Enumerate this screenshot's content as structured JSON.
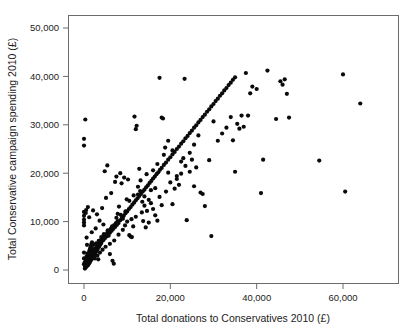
{
  "chart_data": {
    "type": "scatter",
    "title": "",
    "xlabel": "Total donations to Conservatives 2010 (£)",
    "ylabel": "Total Conservative campaign spending 2010 (£)",
    "xlim": [
      -2500,
      72000
    ],
    "ylim": [
      -1800,
      52500
    ],
    "xticks": [
      0,
      20000,
      40000,
      60000
    ],
    "xticklabels": [
      "0",
      "20,000",
      "40,000",
      "60,000"
    ],
    "yticks": [
      0,
      10000,
      20000,
      30000,
      40000,
      50000
    ],
    "yticklabels": [
      "0",
      "10,000",
      "20,000",
      "30,000",
      "40,000",
      "50,000"
    ],
    "grid": false,
    "legend": null,
    "marker": "filled-circle",
    "marker_color": "#0a0a0a",
    "marker_size_px": 4.2,
    "points": [
      [
        200,
        300
      ],
      [
        250,
        700
      ],
      [
        300,
        450
      ],
      [
        350,
        1100
      ],
      [
        400,
        800
      ],
      [
        450,
        1500
      ],
      [
        500,
        600
      ],
      [
        550,
        1800
      ],
      [
        600,
        1000
      ],
      [
        650,
        2100
      ],
      [
        700,
        1300
      ],
      [
        750,
        2400
      ],
      [
        800,
        900
      ],
      [
        850,
        2700
      ],
      [
        900,
        1600
      ],
      [
        950,
        3000
      ],
      [
        1000,
        1100
      ],
      [
        1050,
        3300
      ],
      [
        1100,
        2000
      ],
      [
        1150,
        3600
      ],
      [
        1200,
        1400
      ],
      [
        1250,
        3900
      ],
      [
        1300,
        2300
      ],
      [
        1350,
        4200
      ],
      [
        1400,
        1700
      ],
      [
        1450,
        4500
      ],
      [
        1500,
        2600
      ],
      [
        1550,
        4800
      ],
      [
        1600,
        2000
      ],
      [
        1650,
        5100
      ],
      [
        1700,
        2900
      ],
      [
        1750,
        5400
      ],
      [
        1800,
        2300
      ],
      [
        1850,
        5700
      ],
      [
        1900,
        3200
      ],
      [
        2000,
        2600
      ],
      [
        2100,
        3500
      ],
      [
        2200,
        2900
      ],
      [
        2300,
        3800
      ],
      [
        2400,
        3200
      ],
      [
        2500,
        4100
      ],
      [
        2600,
        3500
      ],
      [
        2700,
        4400
      ],
      [
        2800,
        3800
      ],
      [
        2900,
        4700
      ],
      [
        3000,
        4100
      ],
      [
        3100,
        5000
      ],
      [
        3200,
        4400
      ],
      [
        3300,
        5300
      ],
      [
        3400,
        4700
      ],
      [
        3500,
        5600
      ],
      [
        3600,
        5000
      ],
      [
        3700,
        5900
      ],
      [
        3800,
        5300
      ],
      [
        3900,
        6200
      ],
      [
        4000,
        5600
      ],
      [
        4200,
        6500
      ],
      [
        4400,
        6100
      ],
      [
        4600,
        6900
      ],
      [
        4800,
        6500
      ],
      [
        5000,
        7300
      ],
      [
        5200,
        6900
      ],
      [
        5400,
        7700
      ],
      [
        5600,
        7300
      ],
      [
        5800,
        8100
      ],
      [
        6000,
        7700
      ],
      [
        6200,
        8500
      ],
      [
        6400,
        8100
      ],
      [
        6600,
        8900
      ],
      [
        6800,
        8500
      ],
      [
        7000,
        9300
      ],
      [
        7200,
        8900
      ],
      [
        7400,
        9700
      ],
      [
        7600,
        9300
      ],
      [
        7800,
        10100
      ],
      [
        8000,
        9700
      ],
      [
        8400,
        10300
      ],
      [
        8800,
        10800
      ],
      [
        9200,
        11200
      ],
      [
        9600,
        11700
      ],
      [
        10000,
        12100
      ],
      [
        10400,
        12600
      ],
      [
        10800,
        13000
      ],
      [
        11200,
        13500
      ],
      [
        11600,
        13900
      ],
      [
        12000,
        14400
      ],
      [
        12400,
        14800
      ],
      [
        12800,
        15300
      ],
      [
        13200,
        15700
      ],
      [
        13600,
        16200
      ],
      [
        14000,
        16600
      ],
      [
        14400,
        17100
      ],
      [
        14800,
        17500
      ],
      [
        15200,
        18000
      ],
      [
        15600,
        18400
      ],
      [
        16000,
        18900
      ],
      [
        16400,
        19300
      ],
      [
        16800,
        19800
      ],
      [
        17200,
        20200
      ],
      [
        17600,
        20700
      ],
      [
        18000,
        21100
      ],
      [
        18500,
        21700
      ],
      [
        19000,
        22200
      ],
      [
        19500,
        22800
      ],
      [
        20000,
        23300
      ],
      [
        20500,
        23900
      ],
      [
        21000,
        24400
      ],
      [
        21500,
        25000
      ],
      [
        22000,
        25500
      ],
      [
        22500,
        26100
      ],
      [
        23000,
        26600
      ],
      [
        23500,
        27200
      ],
      [
        24000,
        27700
      ],
      [
        24500,
        28300
      ],
      [
        25000,
        28800
      ],
      [
        25500,
        29400
      ],
      [
        26000,
        29900
      ],
      [
        26500,
        30500
      ],
      [
        27000,
        31000
      ],
      [
        27500,
        31600
      ],
      [
        28000,
        32100
      ],
      [
        28500,
        32700
      ],
      [
        29000,
        33200
      ],
      [
        29500,
        33800
      ],
      [
        30000,
        34300
      ],
      [
        30500,
        34900
      ],
      [
        31000,
        35400
      ],
      [
        31500,
        36000
      ],
      [
        32000,
        36500
      ],
      [
        32500,
        37100
      ],
      [
        33000,
        37600
      ],
      [
        33500,
        38200
      ],
      [
        34000,
        38700
      ],
      [
        34500,
        39300
      ],
      [
        35000,
        39800
      ],
      [
        0,
        1200
      ],
      [
        0,
        2400
      ],
      [
        0,
        3600
      ],
      [
        0,
        9200
      ],
      [
        0,
        9800
      ],
      [
        0,
        10400
      ],
      [
        0,
        11200
      ],
      [
        0,
        12000
      ],
      [
        0,
        25700
      ],
      [
        0,
        27100
      ],
      [
        300,
        31100
      ],
      [
        400,
        11800
      ],
      [
        500,
        12400
      ],
      [
        600,
        6700
      ],
      [
        700,
        5200
      ],
      [
        900,
        13000
      ],
      [
        1200,
        10900
      ],
      [
        1500,
        4300
      ],
      [
        1800,
        7800
      ],
      [
        2100,
        12300
      ],
      [
        2400,
        3100
      ],
      [
        2700,
        8600
      ],
      [
        3000,
        11500
      ],
      [
        3300,
        2200
      ],
      [
        3600,
        10200
      ],
      [
        3900,
        5900
      ],
      [
        4200,
        12800
      ],
      [
        4500,
        9400
      ],
      [
        4800,
        20400
      ],
      [
        5100,
        14900
      ],
      [
        5400,
        21600
      ],
      [
        5700,
        7100
      ],
      [
        6000,
        3300
      ],
      [
        6300,
        15900
      ],
      [
        6600,
        1900
      ],
      [
        6900,
        1300
      ],
      [
        7200,
        18200
      ],
      [
        7500,
        19300
      ],
      [
        7800,
        11600
      ],
      [
        8100,
        13100
      ],
      [
        8400,
        20000
      ],
      [
        8700,
        17900
      ],
      [
        9000,
        8300
      ],
      [
        9300,
        19100
      ],
      [
        9600,
        12100
      ],
      [
        9900,
        14600
      ],
      [
        10200,
        18700
      ],
      [
        10500,
        7200
      ],
      [
        10800,
        6900
      ],
      [
        11100,
        6800
      ],
      [
        11400,
        9000
      ],
      [
        11700,
        31700
      ],
      [
        12000,
        29100
      ],
      [
        12200,
        29800
      ],
      [
        12500,
        15600
      ],
      [
        12800,
        20900
      ],
      [
        13100,
        18500
      ],
      [
        13400,
        11900
      ],
      [
        13700,
        10100
      ],
      [
        14000,
        13300
      ],
      [
        14300,
        8800
      ],
      [
        14600,
        12200
      ],
      [
        15000,
        9800
      ],
      [
        15500,
        16500
      ],
      [
        16000,
        12600
      ],
      [
        16500,
        11300
      ],
      [
        17000,
        10200
      ],
      [
        17500,
        39700
      ],
      [
        18000,
        31500
      ],
      [
        18300,
        31300
      ],
      [
        18800,
        25300
      ],
      [
        19500,
        26700
      ],
      [
        20000,
        18100
      ],
      [
        20500,
        13600
      ],
      [
        21000,
        16800
      ],
      [
        21500,
        19400
      ],
      [
        22000,
        17600
      ],
      [
        22500,
        22400
      ],
      [
        23000,
        23100
      ],
      [
        23300,
        39500
      ],
      [
        23800,
        10300
      ],
      [
        24500,
        20300
      ],
      [
        25000,
        22800
      ],
      [
        25500,
        17300
      ],
      [
        26000,
        21200
      ],
      [
        26500,
        27800
      ],
      [
        27000,
        16000
      ],
      [
        27500,
        15700
      ],
      [
        28000,
        13200
      ],
      [
        29000,
        22700
      ],
      [
        29500,
        7000
      ],
      [
        30000,
        30700
      ],
      [
        31000,
        26700
      ],
      [
        32000,
        28200
      ],
      [
        33000,
        29400
      ],
      [
        34000,
        31600
      ],
      [
        34500,
        26800
      ],
      [
        35000,
        20300
      ],
      [
        35500,
        30200
      ],
      [
        36000,
        29200
      ],
      [
        36500,
        31900
      ],
      [
        37000,
        29600
      ],
      [
        37500,
        40700
      ],
      [
        38000,
        31900
      ],
      [
        38500,
        36500
      ],
      [
        39000,
        37900
      ],
      [
        40000,
        37400
      ],
      [
        41000,
        15900
      ],
      [
        41500,
        22800
      ],
      [
        42500,
        41200
      ],
      [
        44500,
        31200
      ],
      [
        45500,
        39000
      ],
      [
        46000,
        38300
      ],
      [
        46500,
        39400
      ],
      [
        47000,
        36400
      ],
      [
        47500,
        31500
      ],
      [
        54500,
        22600
      ],
      [
        60000,
        40400
      ],
      [
        60500,
        16200
      ],
      [
        64000,
        34400
      ],
      [
        200,
        1600
      ],
      [
        400,
        2100
      ],
      [
        600,
        2800
      ],
      [
        800,
        3400
      ],
      [
        1000,
        1900
      ],
      [
        1300,
        2500
      ],
      [
        1600,
        3900
      ],
      [
        1900,
        4400
      ],
      [
        2200,
        5200
      ],
      [
        2500,
        2400
      ],
      [
        2800,
        5500
      ],
      [
        3100,
        3000
      ],
      [
        3400,
        6000
      ],
      [
        3700,
        3600
      ],
      [
        4000,
        6800
      ],
      [
        4300,
        4200
      ],
      [
        4600,
        7400
      ],
      [
        5000,
        4800
      ],
      [
        5500,
        8200
      ],
      [
        6000,
        5400
      ],
      [
        6500,
        9000
      ],
      [
        7000,
        6100
      ],
      [
        7500,
        10800
      ],
      [
        8000,
        7300
      ],
      [
        8500,
        11400
      ],
      [
        9000,
        10600
      ],
      [
        9500,
        9200
      ],
      [
        10000,
        10000
      ],
      [
        10500,
        14300
      ],
      [
        11000,
        10500
      ],
      [
        11500,
        15400
      ],
      [
        12000,
        11000
      ],
      [
        12500,
        17200
      ],
      [
        13000,
        16300
      ],
      [
        13500,
        14100
      ],
      [
        14000,
        15200
      ],
      [
        14500,
        19800
      ],
      [
        15000,
        14500
      ],
      [
        15500,
        13800
      ],
      [
        16000,
        20600
      ],
      [
        16500,
        16900
      ],
      [
        17000,
        21900
      ],
      [
        17500,
        15100
      ],
      [
        18000,
        13400
      ],
      [
        18500,
        23800
      ],
      [
        19000,
        16200
      ],
      [
        19500,
        20100
      ],
      [
        20500,
        24700
      ],
      [
        21500,
        18800
      ],
      [
        22500,
        19900
      ],
      [
        23500,
        21500
      ],
      [
        24500,
        24200
      ],
      [
        25500,
        25900
      ]
    ]
  },
  "axes": {
    "x_tick_labels": [
      "0",
      "20,000",
      "40,000",
      "60,000"
    ],
    "y_tick_labels": [
      "0",
      "10,000",
      "20,000",
      "30,000",
      "40,000",
      "50,000"
    ],
    "x_title": "Total donations to Conservatives 2010 (£)",
    "y_title": "Total Conservative campaign spending 2010 (£)"
  }
}
